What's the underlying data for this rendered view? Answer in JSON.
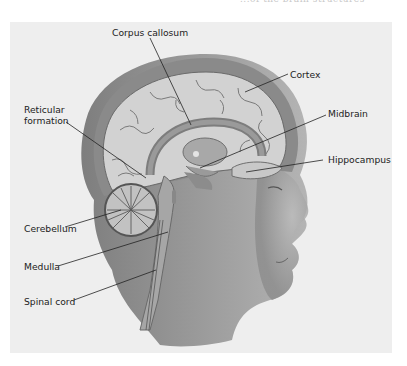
{
  "page": {
    "header_fragment": "...of the brain structures"
  },
  "figure": {
    "colors": {
      "panel_background": "#eeeeee",
      "skull": "#8a8a8a",
      "brain_tissue": "#cfcfcf",
      "skin": "#9a9a9a",
      "leader_line": "#222222"
    },
    "labels": {
      "corpus_callosum": "Corpus callosum",
      "cortex": "Cortex",
      "reticular_formation_1": "Reticular",
      "reticular_formation_2": "formation",
      "midbrain": "Midbrain",
      "hippocampus": "Hippocampus",
      "cerebellum": "Cerebellum",
      "medulla": "Medulla",
      "spinal_cord": "Spinal cord"
    }
  }
}
